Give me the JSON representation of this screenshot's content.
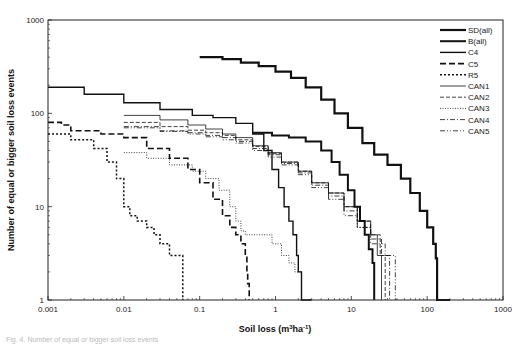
{
  "chart_data": {
    "type": "line",
    "title": "",
    "xlabel": "Soil loss (m³ha⁻¹)",
    "ylabel": "Number of equal or bigger soil loss events",
    "xscale": "log",
    "yscale": "log",
    "xlim": [
      0.001,
      1000
    ],
    "ylim": [
      1,
      1000
    ],
    "xticks": [
      "0.001",
      "0.01",
      "0.1",
      "1",
      "10",
      "100",
      "1000"
    ],
    "yticks": [
      "1",
      "10",
      "100",
      "1000"
    ],
    "grid": false,
    "legend_position": "upper right inside",
    "series": [
      {
        "name": "SD(all)",
        "style": "thick-solid",
        "width": 2.2,
        "dash": "",
        "x": [
          0.1,
          0.2,
          0.35,
          0.6,
          1,
          1.6,
          2.5,
          4,
          6,
          9,
          14,
          20,
          30,
          45,
          60,
          80,
          100,
          120,
          130,
          135,
          135,
          200
        ],
        "y": [
          400,
          380,
          350,
          320,
          280,
          240,
          190,
          140,
          100,
          70,
          48,
          36,
          28,
          20,
          14,
          9,
          6,
          4,
          2.8,
          1.9,
          1,
          1
        ]
      },
      {
        "name": "B(all)",
        "style": "thick-dash",
        "width": 2.0,
        "dash": "",
        "x": [
          0.5,
          0.9,
          1.5,
          2.5,
          4,
          5.5,
          7,
          9,
          11,
          13,
          15,
          17,
          19,
          20,
          20
        ],
        "y": [
          62,
          58,
          55,
          50,
          40,
          30,
          22,
          15,
          10,
          7,
          5,
          3.5,
          2.5,
          1.6,
          1
        ]
      },
      {
        "name": "C4",
        "style": "solid",
        "width": 1.4,
        "dash": "",
        "x": [
          0.001,
          0.003,
          0.01,
          0.03,
          0.08,
          0.15,
          0.3,
          0.5,
          0.7,
          0.9,
          1.1,
          1.3,
          1.5,
          1.7,
          1.9,
          2.0,
          2.2,
          2.2,
          3
        ],
        "y": [
          190,
          160,
          130,
          110,
          95,
          90,
          78,
          60,
          40,
          25,
          16,
          10,
          7,
          5,
          3,
          2,
          1.5,
          1,
          1
        ]
      },
      {
        "name": "C5",
        "style": "long-dash",
        "width": 1.6,
        "dash": "6,3",
        "x": [
          0.001,
          0.0015,
          0.002,
          0.005,
          0.01,
          0.02,
          0.04,
          0.07,
          0.1,
          0.15,
          0.2,
          0.25,
          0.3,
          0.35,
          0.4,
          0.42,
          0.43,
          0.45
        ],
        "y": [
          80,
          75,
          65,
          60,
          55,
          42,
          33,
          25,
          18,
          12,
          8,
          6,
          5,
          4,
          3,
          2,
          1.5,
          1
        ]
      },
      {
        "name": "R5",
        "style": "dotted",
        "width": 1.5,
        "dash": "2,2",
        "x": [
          0.001,
          0.002,
          0.004,
          0.006,
          0.008,
          0.01,
          0.012,
          0.015,
          0.02,
          0.025,
          0.03,
          0.04,
          0.05,
          0.06,
          0.06
        ],
        "y": [
          60,
          52,
          42,
          30,
          20,
          10,
          8,
          7,
          6,
          5,
          4,
          3,
          3,
          2,
          1
        ]
      },
      {
        "name": "CAN1",
        "style": "thin-solid",
        "width": 0.8,
        "dash": "",
        "x": [
          0.01,
          0.03,
          0.07,
          0.12,
          0.2,
          0.3,
          0.5,
          0.8,
          1.2,
          2,
          3,
          5,
          8,
          12,
          18,
          22,
          25,
          25
        ],
        "y": [
          95,
          85,
          75,
          68,
          60,
          55,
          45,
          38,
          30,
          24,
          18,
          14,
          10,
          7,
          5,
          3,
          2,
          1
        ]
      },
      {
        "name": "CAN2",
        "style": "dashed",
        "width": 0.8,
        "dash": "4,2",
        "x": [
          0.01,
          0.03,
          0.07,
          0.12,
          0.2,
          0.3,
          0.5,
          0.8,
          1.2,
          2,
          3,
          5,
          8,
          12,
          18,
          24,
          28,
          28
        ],
        "y": [
          80,
          72,
          66,
          62,
          58,
          52,
          44,
          37,
          30,
          24,
          18,
          14,
          10,
          7,
          5,
          3,
          2,
          1
        ]
      },
      {
        "name": "CAN3",
        "style": "dotted-thin",
        "width": 0.8,
        "dash": "1,1.5",
        "x": [
          0.01,
          0.02,
          0.04,
          0.08,
          0.12,
          0.18,
          0.25,
          0.3,
          0.35,
          0.4,
          0.45,
          0.6,
          0.9,
          1.2,
          1.5,
          1.8,
          2,
          2.2,
          2.2
        ],
        "y": [
          38,
          33,
          28,
          24,
          20,
          15,
          10,
          7,
          5.5,
          5,
          5,
          5,
          4,
          3,
          2.5,
          2,
          2,
          1.5,
          1
        ]
      },
      {
        "name": "CAN4",
        "style": "dash-dot",
        "width": 0.8,
        "dash": "5,2,1,2",
        "x": [
          0.01,
          0.03,
          0.07,
          0.12,
          0.2,
          0.3,
          0.5,
          0.8,
          1.2,
          2,
          3,
          5,
          8,
          12,
          18,
          25,
          32,
          32
        ],
        "y": [
          72,
          65,
          62,
          58,
          55,
          50,
          42,
          36,
          29,
          23,
          17,
          13,
          9,
          6,
          4.5,
          3,
          2,
          1
        ]
      },
      {
        "name": "CAN5",
        "style": "dash-dot-dot",
        "width": 0.8,
        "dash": "5,2,1,2,1,2",
        "x": [
          0.01,
          0.03,
          0.07,
          0.12,
          0.2,
          0.3,
          0.5,
          0.8,
          1.2,
          2,
          3,
          5,
          8,
          12,
          18,
          28,
          38,
          38
        ],
        "y": [
          70,
          64,
          60,
          56,
          52,
          48,
          40,
          34,
          28,
          22,
          16,
          12,
          8,
          6,
          4,
          3,
          2,
          1
        ]
      }
    ]
  },
  "axes": {
    "x_title_main": "Soil loss (m",
    "x_title_sup1": "3",
    "x_title_mid": "ha",
    "x_title_sup2": "-1",
    "x_title_end": ")",
    "y_title": "Number of equal or bigger soil loss events"
  },
  "caption": "Fig. 4. Number of equal or bigger soil loss events"
}
